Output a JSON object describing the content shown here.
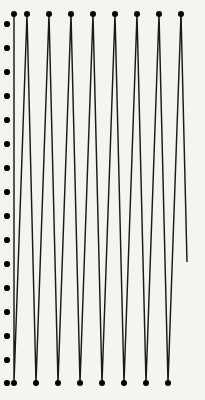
{
  "figure": {
    "background_color": "#f6f4f1",
    "stroke_color": "#1a1a1a",
    "dot_color": "#000000",
    "width": 205,
    "height": 400
  },
  "chart_data": {
    "type": "line",
    "subtitle": "",
    "xlabel": "",
    "ylabel": "",
    "xlim": [
      0,
      205
    ],
    "ylim": [
      0,
      400
    ],
    "grid": false,
    "legend_position": "none",
    "annotations": [],
    "tick_labels": {
      "x": [],
      "y": []
    },
    "series": [
      {
        "name": "sawtooth-polyline",
        "closed": false,
        "points": [
          [
            14,
            14
          ],
          [
            14,
            383
          ],
          [
            27,
            14
          ],
          [
            36,
            383
          ],
          [
            49,
            14
          ],
          [
            58,
            383
          ],
          [
            71,
            14
          ],
          [
            80,
            383
          ],
          [
            93,
            14
          ],
          [
            102,
            383
          ],
          [
            115,
            14
          ],
          [
            124,
            383
          ],
          [
            137,
            14
          ],
          [
            146,
            383
          ],
          [
            159,
            14
          ],
          [
            168,
            383
          ],
          [
            181,
            14
          ]
        ]
      },
      {
        "name": "terminated-tail",
        "closed": false,
        "points": [
          [
            181,
            14
          ],
          [
            187,
            262
          ]
        ]
      }
    ],
    "top_peaks_x": [
      14,
      27,
      49,
      71,
      93,
      115,
      137,
      159,
      181
    ],
    "top_peaks_y": 14,
    "bottom_troughs_x": [
      14,
      36,
      58,
      80,
      102,
      124,
      146,
      168
    ],
    "bottom_troughs_y": 383,
    "peak_count": 9,
    "trough_count": 8,
    "tail_end_point": [
      187,
      262
    ],
    "margin_dots": {
      "name": "left-margin-dot-column",
      "x": 7,
      "radius": 3.1,
      "y_values": [
        24,
        48,
        72,
        96,
        120,
        144,
        168,
        192,
        216,
        240,
        264,
        288,
        312,
        336,
        360,
        383
      ],
      "count": 16
    },
    "vertex_dot_radius": 3.0
  }
}
